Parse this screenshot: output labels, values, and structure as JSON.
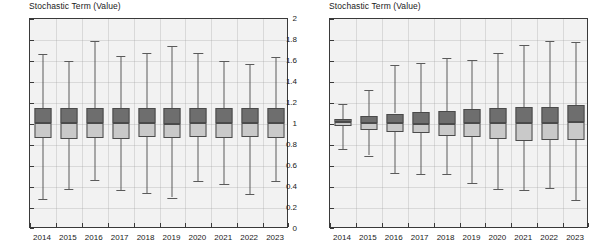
{
  "charts": [
    {
      "id": "left",
      "title": "Stochastic Term (Value)",
      "ylabel": "",
      "xlabel": "",
      "ylim": [
        0,
        2
      ],
      "yticks": [
        "0",
        "0.2",
        "0.4",
        "0.6",
        "0.8",
        "1",
        "1.2",
        "1.4",
        "1.6",
        "1.8",
        "2"
      ],
      "ytick_values": [
        0,
        0.2,
        0.4,
        0.6,
        0.8,
        1.0,
        1.2,
        1.4,
        1.6,
        1.8,
        2.0
      ],
      "categories": [
        "2014",
        "2015",
        "2016",
        "2017",
        "2018",
        "2019",
        "2020",
        "2021",
        "2022",
        "2023"
      ]
    },
    {
      "id": "right",
      "title": "Stochastic Term (Value)",
      "ylabel": "",
      "xlabel": "",
      "ylim": [
        0,
        2
      ],
      "yticks": [
        "0",
        "0.2",
        "0.4",
        "0.6",
        "0.8",
        "1",
        "1.2",
        "1.4",
        "1.6",
        "1.8",
        "2"
      ],
      "ytick_values": [
        0,
        0.2,
        0.4,
        0.6,
        0.8,
        1.0,
        1.2,
        1.4,
        1.6,
        1.8,
        2.0
      ],
      "categories": [
        "2014",
        "2015",
        "2016",
        "2017",
        "2018",
        "2019",
        "2020",
        "2021",
        "2022",
        "2023"
      ]
    }
  ],
  "chart_data": [
    {
      "type": "box",
      "title": "Stochastic Term (Value)",
      "xlabel": "",
      "ylabel": "Stochastic Term (Value)",
      "ylim": [
        0,
        2
      ],
      "grid": true,
      "legend": "none",
      "categories": [
        "2014",
        "2015",
        "2016",
        "2017",
        "2018",
        "2019",
        "2020",
        "2021",
        "2022",
        "2023"
      ],
      "boxes": [
        {
          "category": "2014",
          "whisker_low": 0.29,
          "q1": 0.87,
          "median": 1.01,
          "q3": 1.15,
          "whisker_high": 1.67
        },
        {
          "category": "2015",
          "whisker_low": 0.38,
          "q1": 0.86,
          "median": 1.01,
          "q3": 1.15,
          "whisker_high": 1.6
        },
        {
          "category": "2016",
          "whisker_low": 0.47,
          "q1": 0.87,
          "median": 1.01,
          "q3": 1.15,
          "whisker_high": 1.79
        },
        {
          "category": "2017",
          "whisker_low": 0.37,
          "q1": 0.86,
          "median": 1.01,
          "q3": 1.15,
          "whisker_high": 1.65
        },
        {
          "category": "2018",
          "whisker_low": 0.34,
          "q1": 0.88,
          "median": 1.01,
          "q3": 1.15,
          "whisker_high": 1.68
        },
        {
          "category": "2019",
          "whisker_low": 0.3,
          "q1": 0.87,
          "median": 1.0,
          "q3": 1.15,
          "whisker_high": 1.74
        },
        {
          "category": "2020",
          "whisker_low": 0.46,
          "q1": 0.88,
          "median": 1.01,
          "q3": 1.15,
          "whisker_high": 1.68
        },
        {
          "category": "2021",
          "whisker_low": 0.43,
          "q1": 0.87,
          "median": 1.01,
          "q3": 1.15,
          "whisker_high": 1.6
        },
        {
          "category": "2022",
          "whisker_low": 0.33,
          "q1": 0.88,
          "median": 1.01,
          "q3": 1.15,
          "whisker_high": 1.57
        },
        {
          "category": "2023",
          "whisker_low": 0.46,
          "q1": 0.87,
          "median": 1.01,
          "q3": 1.15,
          "whisker_high": 1.64
        }
      ]
    },
    {
      "type": "box",
      "title": "Stochastic Term (Value)",
      "xlabel": "",
      "ylabel": "Stochastic Term (Value)",
      "ylim": [
        0,
        2
      ],
      "grid": true,
      "legend": "none",
      "categories": [
        "2014",
        "2015",
        "2016",
        "2017",
        "2018",
        "2019",
        "2020",
        "2021",
        "2022",
        "2023"
      ],
      "boxes": [
        {
          "category": "2014",
          "whisker_low": 0.76,
          "q1": 0.98,
          "median": 1.02,
          "q3": 1.05,
          "whisker_high": 1.19
        },
        {
          "category": "2015",
          "whisker_low": 0.7,
          "q1": 0.94,
          "median": 1.01,
          "q3": 1.08,
          "whisker_high": 1.32
        },
        {
          "category": "2016",
          "whisker_low": 0.53,
          "q1": 0.92,
          "median": 1.01,
          "q3": 1.1,
          "whisker_high": 1.56
        },
        {
          "category": "2017",
          "whisker_low": 0.52,
          "q1": 0.91,
          "median": 1.0,
          "q3": 1.11,
          "whisker_high": 1.58
        },
        {
          "category": "2018",
          "whisker_low": 0.52,
          "q1": 0.89,
          "median": 1.0,
          "q3": 1.12,
          "whisker_high": 1.63
        },
        {
          "category": "2019",
          "whisker_low": 0.44,
          "q1": 0.88,
          "median": 1.01,
          "q3": 1.14,
          "whisker_high": 1.61
        },
        {
          "category": "2020",
          "whisker_low": 0.38,
          "q1": 0.86,
          "median": 1.01,
          "q3": 1.15,
          "whisker_high": 1.68
        },
        {
          "category": "2021",
          "whisker_low": 0.37,
          "q1": 0.84,
          "median": 1.01,
          "q3": 1.16,
          "whisker_high": 1.75
        },
        {
          "category": "2022",
          "whisker_low": 0.39,
          "q1": 0.85,
          "median": 1.01,
          "q3": 1.16,
          "whisker_high": 1.79
        },
        {
          "category": "2023",
          "whisker_low": 0.28,
          "q1": 0.85,
          "median": 1.02,
          "q3": 1.18,
          "whisker_high": 1.78
        }
      ]
    }
  ],
  "style": {
    "box_upper_color": "#6e6e6e",
    "box_lower_color": "#c9c9c9",
    "outline_color": "#4a4a4a",
    "plot_background": "#f2f2f2",
    "axis_color": "#3a3a3a",
    "text_color": "#1a1a1a"
  }
}
